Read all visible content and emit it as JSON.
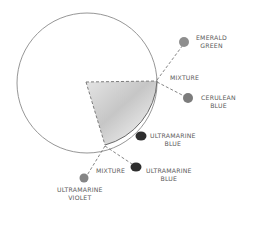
{
  "diagram": {
    "colors": {
      "circle_stroke": "#8a8a8a",
      "dash": "#6f6f6f",
      "wedge_light": "#dcdcdc",
      "wedge_dark": "#a8a8a8",
      "emerald_green": "#8e8e8e",
      "cerulean_blue": "#7c7c7c",
      "ultramarine_blue": "#2e2e2e",
      "ultramarine_violet": "#858585"
    },
    "labels": {
      "emerald_green_1": "EMERALD",
      "emerald_green_2": "GREEN",
      "mixture_top": "MIXTURE",
      "cerulean_1": "CERULEAN",
      "cerulean_2": "BLUE",
      "ultramarine_blue_a_1": "ULTRAMARINE",
      "ultramarine_blue_a_2": "BLUE",
      "mixture_bottom": "MIXTURE",
      "ultramarine_blue_b_1": "ULTRAMARINE",
      "ultramarine_blue_b_2": "BLUE",
      "ultramarine_violet_1": "ULTRAMARINE",
      "ultramarine_violet_2": "VIOLET"
    }
  }
}
